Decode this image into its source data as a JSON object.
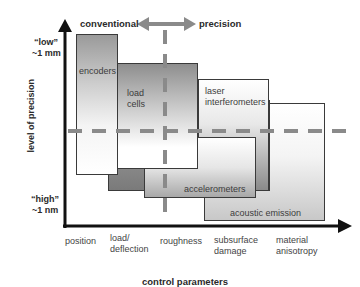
{
  "diagram": {
    "header": {
      "left_label": "conventional",
      "right_label": "precision"
    },
    "y_axis": {
      "title": "level of precision",
      "top_label_line1": "“low”",
      "top_label_line2": "~1 mm",
      "bottom_label_line1": "“high”",
      "bottom_label_line2": "~1 nm"
    },
    "x_axis": {
      "title": "control parameters",
      "ticks": [
        {
          "line1": "position",
          "line2": ""
        },
        {
          "line1": "load/",
          "line2": "deflection"
        },
        {
          "line1": "roughness",
          "line2": ""
        },
        {
          "line1": "subsurface",
          "line2": "damage"
        },
        {
          "line1": "material",
          "line2": "anisotropy"
        }
      ]
    },
    "regions": [
      {
        "name": "encoders",
        "label_line1": "encoders",
        "label_line2": ""
      },
      {
        "name": "load cells",
        "label_line1": "load",
        "label_line2": "cells"
      },
      {
        "name": "laser interferometers",
        "label_line1": "laser",
        "label_line2": "interferometers"
      },
      {
        "name": "accelerometers",
        "label_line1": "accelerometers",
        "label_line2": ""
      },
      {
        "name": "acoustic emission",
        "label_line1": "acoustic emission",
        "label_line2": ""
      }
    ],
    "colors": {
      "axis": "#111111",
      "dashed_line": "#8a8a8a",
      "box_border": "#3a3a3a"
    }
  }
}
